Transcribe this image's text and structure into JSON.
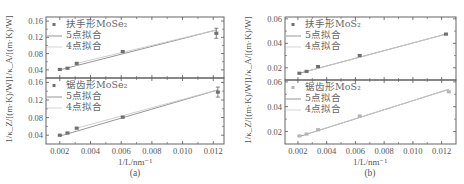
{
  "figure": {
    "panels": [
      {
        "caption": "(a)",
        "xlabel": "1/L/nm⁻¹",
        "xticks": [
          "0.002",
          "0.004",
          "0.006",
          "0.008",
          "0.010",
          "0.012"
        ],
        "subplots": [
          {
            "ylabel": "1/κ_A/[(m·K)/W]",
            "yticks": [
              "0.04",
              "0.08",
              "0.12",
              "0.16"
            ],
            "legend": [
              "扶手形MoSe₂",
              "5点拟合",
              "4点拟合"
            ]
          },
          {
            "ylabel": "1/κ_Z/[(m·K)/W]",
            "yticks": [
              "0.04",
              "0.08",
              "0.12",
              "0.16"
            ],
            "legend": [
              "锯齿形MoSe₂",
              "5点拟合",
              "4点拟合"
            ]
          }
        ]
      },
      {
        "caption": "(b)",
        "xlabel": "1/L/nm⁻¹",
        "xticks": [
          "0.002",
          "0.004",
          "0.006",
          "0.008",
          "0.010",
          "0.012"
        ],
        "subplots": [
          {
            "ylabel": "1/κ_A/[(m·K)/W]",
            "yticks": [
              "0.02",
              "0.04",
              "0.06"
            ],
            "legend": [
              "扶手形MoS₂",
              "5点拟合",
              "4点拟合"
            ]
          },
          {
            "ylabel": "1/κ_Z/[(m·K)/W]",
            "yticks": [
              "0.02",
              "0.04",
              "0.06"
            ],
            "legend": [
              "锯齿形MoS₂",
              "5点拟合",
              "4点拟合"
            ]
          }
        ]
      }
    ]
  },
  "chart_data": [
    {
      "type": "scatter",
      "title": "(a) 扶手形MoSe₂",
      "xlabel": "1/L/nm⁻¹",
      "ylabel": "1/κ_A/[(m·K)/W]",
      "xlim": [
        0.0011,
        0.0127
      ],
      "ylim": [
        0.02,
        0.17
      ],
      "x": [
        0.002,
        0.0025,
        0.0031,
        0.0061,
        0.0122
      ],
      "series": [
        {
          "name": "扶手形MoSe₂",
          "values": [
            0.041,
            0.044,
            0.056,
            0.085,
            0.13
          ]
        },
        {
          "name": "5点拟合",
          "line": [
            [
              0.002,
              0.04
            ],
            [
              0.0122,
              0.138
            ]
          ]
        },
        {
          "name": "4点拟合",
          "line": [
            [
              0.0031,
              0.056
            ],
            [
              0.0122,
              0.138
            ]
          ]
        }
      ],
      "legend_position": "upper left"
    },
    {
      "type": "scatter",
      "title": "(a) 锯齿形MoSe₂",
      "xlabel": "1/L/nm⁻¹",
      "ylabel": "1/κ_Z/[(m·K)/W]",
      "xlim": [
        0.0011,
        0.0127
      ],
      "ylim": [
        0.02,
        0.17
      ],
      "x": [
        0.002,
        0.0025,
        0.0031,
        0.0061,
        0.0123
      ],
      "series": [
        {
          "name": "锯齿形MoSe₂",
          "values": [
            0.04,
            0.045,
            0.056,
            0.081,
            0.138
          ]
        },
        {
          "name": "5点拟合",
          "line": [
            [
              0.002,
              0.038
            ],
            [
              0.0123,
              0.143
            ]
          ]
        },
        {
          "name": "4点拟合",
          "line": [
            [
              0.0031,
              0.056
            ],
            [
              0.0123,
              0.143
            ]
          ]
        }
      ],
      "legend_position": "upper left"
    },
    {
      "type": "scatter",
      "title": "(b) 扶手形MoS₂",
      "xlabel": "1/L/nm⁻¹",
      "ylabel": "1/κ_A/[(m·K)/W]",
      "xlim": [
        0.0011,
        0.013
      ],
      "ylim": [
        0.01,
        0.0615
      ],
      "x": [
        0.0021,
        0.0026,
        0.0034,
        0.0063,
        0.0123
      ],
      "series": [
        {
          "name": "扶手形MoS₂",
          "values": [
            0.0155,
            0.017,
            0.021,
            0.03,
            0.0475
          ]
        },
        {
          "name": "5点拟合",
          "line": [
            [
              0.0021,
              0.0155
            ],
            [
              0.0123,
              0.0475
            ]
          ]
        },
        {
          "name": "4点拟合",
          "line": [
            [
              0.0026,
              0.017
            ],
            [
              0.0123,
              0.0475
            ]
          ]
        }
      ],
      "legend_position": "upper left"
    },
    {
      "type": "scatter",
      "title": "(b) 锯齿形MoS₂",
      "xlabel": "1/L/nm⁻¹",
      "ylabel": "1/κ_Z/[(m·K)/W]",
      "xlim": [
        0.0011,
        0.013
      ],
      "ylim": [
        0.01,
        0.0615
      ],
      "x": [
        0.0021,
        0.0026,
        0.0034,
        0.0063,
        0.0125
      ],
      "series": [
        {
          "name": "锯齿形MoS₂",
          "values": [
            0.0165,
            0.018,
            0.0215,
            0.0325,
            0.052
          ]
        },
        {
          "name": "5点拟合",
          "line": [
            [
              0.0021,
              0.016
            ],
            [
              0.0125,
              0.054
            ]
          ]
        },
        {
          "name": "4点拟合",
          "line": [
            [
              0.0026,
              0.018
            ],
            [
              0.0125,
              0.054
            ]
          ]
        }
      ],
      "legend_position": "upper left"
    }
  ]
}
